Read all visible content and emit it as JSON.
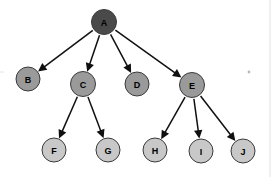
{
  "diagram": {
    "type": "directed-tree",
    "background_color": "#ffffff",
    "edge_color": "#101010",
    "width": 276,
    "height": 177,
    "levels": [
      {
        "index": 0,
        "y": 22,
        "node_fill": "#4a4a4a",
        "radius": 12
      },
      {
        "index": 1,
        "y": 84,
        "node_fill": "#9a9a9a",
        "radius": 12
      },
      {
        "index": 2,
        "y": 150,
        "node_fill": "#c8c8c8",
        "radius": 12
      }
    ],
    "nodes": [
      {
        "id": "A",
        "label": "A",
        "cx": 104,
        "cy": 22,
        "r": 12.5,
        "fill": "#4a4a4a",
        "level": 0,
        "label_color": "#0d0d0d"
      },
      {
        "id": "B",
        "label": "B",
        "cx": 28,
        "cy": 79,
        "r": 12,
        "fill": "#9a9a9a",
        "level": 1,
        "label_color": "#111111"
      },
      {
        "id": "C",
        "label": "C",
        "cx": 83,
        "cy": 84,
        "r": 12.5,
        "fill": "#9a9a9a",
        "level": 1,
        "label_color": "#111111"
      },
      {
        "id": "D",
        "label": "D",
        "cx": 137,
        "cy": 84,
        "r": 12,
        "fill": "#9a9a9a",
        "level": 1,
        "label_color": "#111111"
      },
      {
        "id": "E",
        "label": "E",
        "cx": 192,
        "cy": 85,
        "r": 12.5,
        "fill": "#9a9a9a",
        "level": 1,
        "label_color": "#111111"
      },
      {
        "id": "F",
        "label": "F",
        "cx": 54,
        "cy": 150,
        "r": 12,
        "fill": "#c8c8c8",
        "level": 2,
        "label_color": "#1a1a1a"
      },
      {
        "id": "G",
        "label": "G",
        "cx": 108,
        "cy": 150,
        "r": 12,
        "fill": "#c8c8c8",
        "level": 2,
        "label_color": "#1a1a1a"
      },
      {
        "id": "H",
        "label": "H",
        "cx": 155,
        "cy": 150,
        "r": 12,
        "fill": "#c8c8c8",
        "level": 2,
        "label_color": "#1a1a1a"
      },
      {
        "id": "I",
        "label": "I",
        "cx": 201,
        "cy": 151,
        "r": 12,
        "fill": "#c8c8c8",
        "level": 2,
        "label_color": "#1a1a1a"
      },
      {
        "id": "J",
        "label": "J",
        "cx": 243,
        "cy": 151,
        "r": 12,
        "fill": "#c8c8c8",
        "level": 2,
        "label_color": "#1a1a1a"
      }
    ],
    "edges": [
      {
        "from": "A",
        "to": "B",
        "directed": true
      },
      {
        "from": "A",
        "to": "C",
        "directed": true
      },
      {
        "from": "A",
        "to": "D",
        "directed": true
      },
      {
        "from": "A",
        "to": "E",
        "directed": true
      },
      {
        "from": "C",
        "to": "F",
        "directed": true
      },
      {
        "from": "C",
        "to": "G",
        "directed": true
      },
      {
        "from": "E",
        "to": "H",
        "directed": true
      },
      {
        "from": "E",
        "to": "I",
        "directed": true
      },
      {
        "from": "E",
        "to": "J",
        "directed": true
      }
    ],
    "artifacts": [
      {
        "name": "speck",
        "cx": 249,
        "cy": 72,
        "r": 1.4
      },
      {
        "name": "left-edge-tick",
        "x1": 0,
        "y1": 72,
        "x2": 4,
        "y2": 72
      },
      {
        "name": "right-vertical-rule",
        "x1": 270,
        "y1": 0,
        "x2": 270,
        "y2": 177
      }
    ]
  }
}
